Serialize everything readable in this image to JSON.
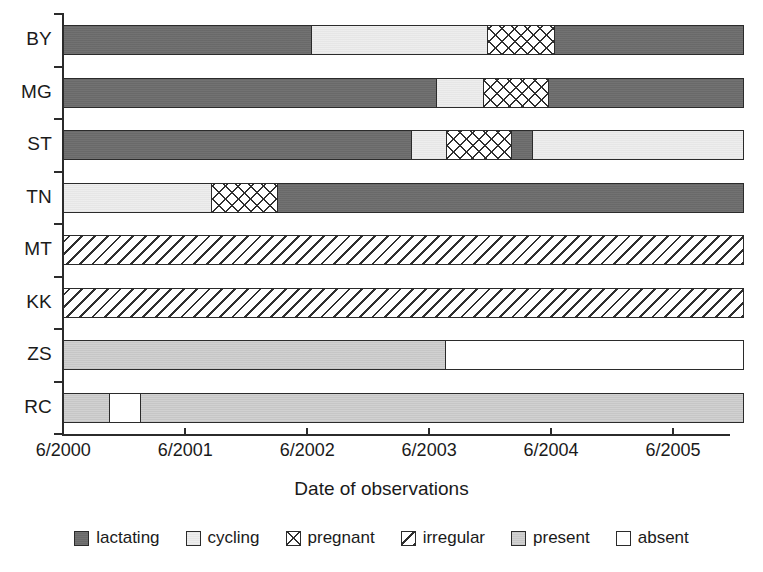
{
  "chart_data": {
    "type": "bar",
    "subtype": "stacked-horizontal-timeline",
    "title": "",
    "xlabel": "Date of observations",
    "ylabel": "",
    "grid": false,
    "legend_position": "bottom",
    "x_tick_labels": [
      "6/2000",
      "6/2001",
      "6/2002",
      "6/2003",
      "6/2004",
      "6/2005"
    ],
    "x_tick_values": [
      0,
      1,
      2,
      3,
      4,
      5
    ],
    "xlim": [
      0,
      5.58
    ],
    "categories": [
      "BY",
      "MG",
      "ST",
      "TN",
      "MT",
      "KK",
      "ZS",
      "RC"
    ],
    "state_labels": [
      "lactating",
      "cycling",
      "pregnant",
      "irregular",
      "present",
      "absent"
    ],
    "state_colors": {
      "lactating": "#6d6d6d",
      "cycling": "#ededed",
      "pregnant": "#ffffff",
      "irregular": "#ffffff",
      "present": "#cfcfcf",
      "absent": "#ffffff"
    },
    "series": [
      {
        "name": "BY",
        "segments": [
          {
            "state": "lactating",
            "start": 0.0,
            "end": 2.03
          },
          {
            "state": "cycling",
            "start": 2.03,
            "end": 3.48
          },
          {
            "state": "pregnant",
            "start": 3.48,
            "end": 4.03
          },
          {
            "state": "lactating",
            "start": 4.03,
            "end": 5.58
          }
        ]
      },
      {
        "name": "MG",
        "segments": [
          {
            "state": "lactating",
            "start": 0.0,
            "end": 3.06
          },
          {
            "state": "cycling",
            "start": 3.06,
            "end": 3.44
          },
          {
            "state": "pregnant",
            "start": 3.44,
            "end": 3.98
          },
          {
            "state": "lactating",
            "start": 3.98,
            "end": 5.58
          }
        ]
      },
      {
        "name": "ST",
        "segments": [
          {
            "state": "lactating",
            "start": 0.0,
            "end": 2.85
          },
          {
            "state": "cycling",
            "start": 2.85,
            "end": 3.14
          },
          {
            "state": "pregnant",
            "start": 3.14,
            "end": 3.67
          },
          {
            "state": "lactating",
            "start": 3.67,
            "end": 3.85
          },
          {
            "state": "cycling",
            "start": 3.85,
            "end": 5.58
          }
        ]
      },
      {
        "name": "TN",
        "segments": [
          {
            "state": "cycling",
            "start": 0.0,
            "end": 1.21
          },
          {
            "state": "pregnant",
            "start": 1.21,
            "end": 1.75
          },
          {
            "state": "lactating",
            "start": 1.75,
            "end": 5.58
          }
        ]
      },
      {
        "name": "MT",
        "segments": [
          {
            "state": "irregular",
            "start": 0.0,
            "end": 5.58
          }
        ]
      },
      {
        "name": "KK",
        "segments": [
          {
            "state": "irregular",
            "start": 0.0,
            "end": 5.58
          }
        ]
      },
      {
        "name": "ZS",
        "segments": [
          {
            "state": "present",
            "start": 0.0,
            "end": 3.13
          },
          {
            "state": "absent",
            "start": 3.13,
            "end": 5.58
          }
        ]
      },
      {
        "name": "RC",
        "segments": [
          {
            "state": "present",
            "start": 0.0,
            "end": 0.37
          },
          {
            "state": "absent",
            "start": 0.37,
            "end": 0.62
          },
          {
            "state": "present",
            "start": 0.62,
            "end": 5.58
          }
        ]
      }
    ]
  },
  "legend": {
    "items": [
      {
        "label": "lactating",
        "swatch": "lactating"
      },
      {
        "label": "cycling",
        "swatch": "cycling"
      },
      {
        "label": "pregnant",
        "swatch": "pregnant"
      },
      {
        "label": "irregular",
        "swatch": "irregular"
      },
      {
        "label": "present",
        "swatch": "present"
      },
      {
        "label": "absent",
        "swatch": "absent"
      }
    ]
  },
  "axis": {
    "x_title": "Date of observations"
  }
}
